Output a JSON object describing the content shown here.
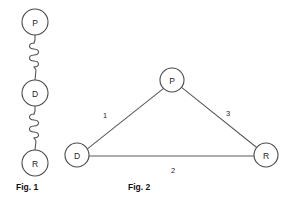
{
  "figures": [
    {
      "id": "fig-1",
      "caption": "Fig. 1",
      "kind": "spring-chain",
      "nodes": [
        {
          "label": "P",
          "cx": 35,
          "cy": 22,
          "r": 13
        },
        {
          "label": "D",
          "cx": 35,
          "cy": 93,
          "r": 13
        },
        {
          "label": "R",
          "cx": 35,
          "cy": 163,
          "r": 13
        }
      ],
      "connectors": [
        {
          "from": "P",
          "to": "D",
          "type": "spring",
          "coils": 4
        },
        {
          "from": "D",
          "to": "R",
          "type": "spring",
          "coils": 4
        }
      ]
    },
    {
      "id": "fig-2",
      "caption": "Fig. 2",
      "kind": "triangle-graph",
      "nodes": [
        {
          "label": "P",
          "cx": 172,
          "cy": 80,
          "r": 12
        },
        {
          "label": "D",
          "cx": 77,
          "cy": 155,
          "r": 12
        },
        {
          "label": "R",
          "cx": 266,
          "cy": 155,
          "r": 12
        }
      ],
      "edges": [
        {
          "from": "D",
          "to": "P",
          "weight": "1",
          "label_x": 105,
          "label_y": 115
        },
        {
          "from": "D",
          "to": "R",
          "weight": "2",
          "label_x": 173,
          "label_y": 170
        },
        {
          "from": "P",
          "to": "R",
          "weight": "3",
          "label_x": 228,
          "label_y": 113
        }
      ]
    }
  ],
  "captions": {
    "fig1": "Fig. 1",
    "fig2": "Fig. 2"
  },
  "nodes": {
    "fig1_p": "P",
    "fig1_d": "D",
    "fig1_r": "R",
    "fig2_p": "P",
    "fig2_d": "D",
    "fig2_r": "R"
  },
  "weights": {
    "dp": "1",
    "dr": "2",
    "pr": "3"
  },
  "colors": {
    "background": "#ffffff",
    "stroke": "#4a4a4a",
    "text": "#1e1e1e"
  }
}
